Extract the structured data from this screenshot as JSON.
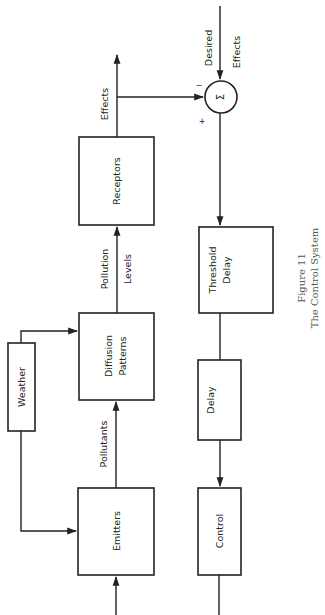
{
  "figure": {
    "number_label": "Figure 11",
    "title": "The Control System"
  },
  "blocks": {
    "emitters": "Emitters",
    "diffusion_line1": "Diffusion",
    "diffusion_line2": "Patterns",
    "receptors": "Receptors",
    "weather": "Weather",
    "threshold_line1": "Threshold",
    "threshold_line2": "Delay",
    "delay": "Delay",
    "control": "Control"
  },
  "signals": {
    "pollutants": "Pollutants",
    "pollution_line1": "Pollution",
    "pollution_line2": "Levels",
    "effects": "Effects",
    "desired_line1": "Desired",
    "desired_line2": "Effects"
  },
  "summing_junction": {
    "symbol": "Σ",
    "minus_sign": "−",
    "plus_sign": "+"
  }
}
